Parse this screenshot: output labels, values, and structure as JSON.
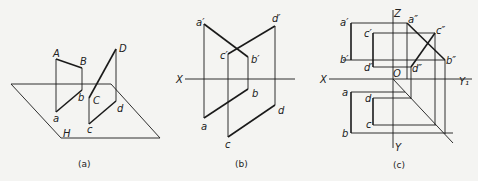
{
  "panels": [
    {
      "id": "a",
      "caption": "(a)",
      "labels": {
        "A": "A",
        "B": "B",
        "C": "C",
        "D": "D",
        "a": "a",
        "b": "b",
        "c": "c",
        "d": "d",
        "H": "H"
      }
    },
    {
      "id": "b",
      "caption": "(b)",
      "labels": {
        "a1": "a′",
        "b1": "b′",
        "c1": "c′",
        "d1": "d′",
        "a": "a",
        "b": "b",
        "c": "c",
        "d": "d",
        "X": "X"
      }
    },
    {
      "id": "c",
      "caption": "(c)",
      "labels": {
        "Z": "Z",
        "X": "X",
        "Y1": "Y₁",
        "Y": "Y",
        "O": "O",
        "a1": "a′",
        "b1": "b′",
        "c1": "c′",
        "d1": "d′",
        "a2": "a″",
        "b2": "b″",
        "c2": "c″",
        "d2": "d″",
        "a": "a",
        "b": "b",
        "c": "c",
        "d": "d"
      }
    }
  ]
}
